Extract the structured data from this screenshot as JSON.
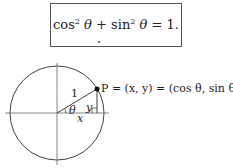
{
  "identity": {
    "cos_part": "cos",
    "sin_part": "sin",
    "exponent": "2",
    "theta": "θ",
    "plus": " + ",
    "equals_one": " = 1."
  },
  "diagram": {
    "radius_label": "1",
    "angle_label": "θ",
    "x_label": "x",
    "y_label": "y",
    "point_label": "P = (x, y) = (cos θ, sin θ)"
  }
}
